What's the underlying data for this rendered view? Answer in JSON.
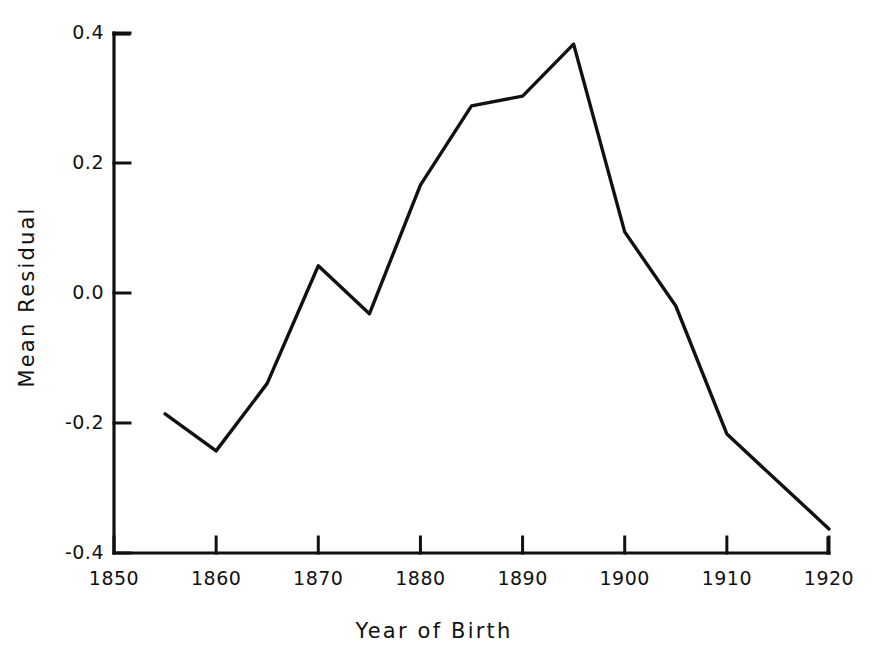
{
  "chart_data": {
    "type": "line",
    "title": "",
    "xlabel": "Year of Birth",
    "ylabel": "Mean Residual",
    "x": [
      1855,
      1860,
      1865,
      1870,
      1875,
      1880,
      1885,
      1890,
      1895,
      1900,
      1905,
      1910,
      1915,
      1920
    ],
    "values": [
      -0.186,
      -0.243,
      -0.139,
      0.042,
      -0.032,
      0.166,
      0.288,
      0.303,
      0.383,
      0.094,
      -0.02,
      -0.217,
      -0.29,
      -0.363
    ],
    "series": [
      {
        "name": "Mean Residual",
        "values": [
          -0.186,
          -0.243,
          -0.139,
          0.042,
          -0.032,
          0.166,
          0.288,
          0.303,
          0.383,
          0.094,
          -0.02,
          -0.217,
          -0.29,
          -0.363
        ]
      }
    ],
    "xlim": [
      1850,
      1920
    ],
    "ylim": [
      -0.4,
      0.4
    ],
    "xticks": [
      1850,
      1860,
      1870,
      1880,
      1890,
      1900,
      1910,
      1920
    ],
    "xtick_labels": [
      "1850",
      "1860",
      "1870",
      "1880",
      "1890",
      "1900",
      "1910",
      "1920"
    ],
    "yticks": [
      -0.4,
      -0.2,
      0.0,
      0.2,
      0.4
    ],
    "ytick_labels": [
      "-0.4",
      "-0.2",
      "0.0",
      "0.2",
      "0.4"
    ],
    "grid": false,
    "legend": null,
    "line_color": "#111111",
    "background_color": "#ffffff",
    "tick_direction": "in",
    "spines": [
      "left",
      "bottom"
    ]
  }
}
